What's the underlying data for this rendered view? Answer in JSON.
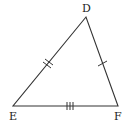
{
  "diagram": {
    "type": "triangle",
    "vertices": {
      "D": {
        "label": "D",
        "x": 86,
        "y": 17
      },
      "E": {
        "label": "E",
        "x": 13,
        "y": 106
      },
      "F": {
        "label": "F",
        "x": 118,
        "y": 106
      }
    },
    "sides": [
      {
        "name": "DE",
        "tick_marks": 2
      },
      {
        "name": "DF",
        "tick_marks": 1
      },
      {
        "name": "EF",
        "tick_marks": 3
      }
    ],
    "colors": {
      "stroke": "#333333",
      "background": "#ffffff"
    }
  }
}
